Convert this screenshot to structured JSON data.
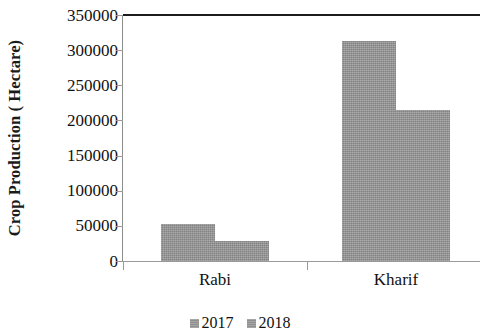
{
  "chart_data": {
    "type": "bar",
    "title": "",
    "xlabel": "",
    "ylabel": "Crop Production ( Hectare)",
    "categories": [
      "Rabi",
      "Kharif"
    ],
    "series": [
      {
        "name": "2017",
        "values": [
          52000,
          313000
        ]
      },
      {
        "name": "2018",
        "values": [
          28000,
          215000
        ]
      }
    ],
    "ylim": [
      0,
      350000
    ],
    "ytick_labels": [
      "350000",
      "300000",
      "250000",
      "200000",
      "150000",
      "100000",
      "50000",
      "0"
    ],
    "ytick_values": [
      350000,
      300000,
      250000,
      200000,
      150000,
      100000,
      50000,
      0
    ],
    "grid": false,
    "legend_position": "bottom",
    "bar_color": "#969696",
    "axis_color": "#1c1c1c"
  },
  "legend": {
    "items": [
      {
        "label": "2017",
        "swatch_name": "legend-swatch-2017"
      },
      {
        "label": "2018",
        "swatch_name": "legend-swatch-2018"
      }
    ]
  }
}
